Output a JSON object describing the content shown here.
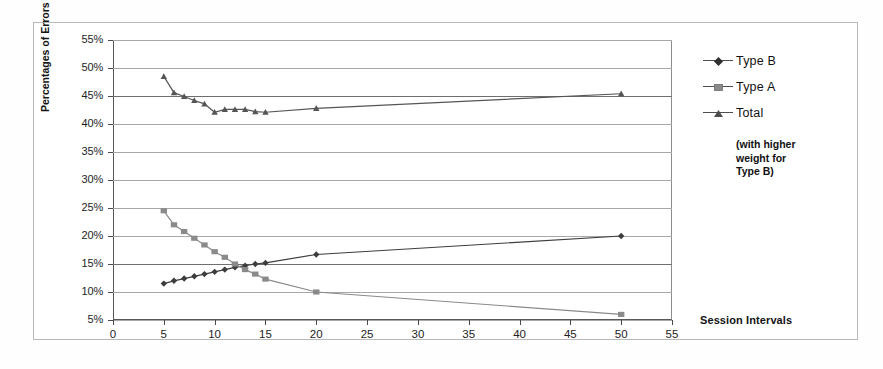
{
  "chart_data": {
    "type": "line",
    "title": "",
    "xlabel": "Session Intervals",
    "ylabel": "Percentages of Errors",
    "xlim": [
      0,
      55
    ],
    "ylim": [
      5,
      55
    ],
    "xticks": [
      0,
      5,
      10,
      15,
      20,
      25,
      30,
      35,
      40,
      45,
      50,
      55
    ],
    "xtick_labels": [
      "0",
      "5",
      "10",
      "15",
      "20",
      "25",
      "30",
      "35",
      "40",
      "45",
      "50",
      "55"
    ],
    "yticks": [
      5,
      10,
      15,
      20,
      25,
      30,
      35,
      40,
      45,
      50,
      55
    ],
    "ytick_labels": [
      "5%",
      "10%",
      "15%",
      "20%",
      "25%",
      "30%",
      "35%",
      "40%",
      "45%",
      "50%",
      "55%"
    ],
    "grid": "horizontal",
    "legend_position": "right",
    "legend_note": "(with higher weight for Type B)",
    "series": [
      {
        "name": "Type B",
        "marker": "diamond",
        "color": "#3d3d3d",
        "x": [
          5,
          6,
          7,
          8,
          9,
          10,
          11,
          12,
          13,
          14,
          15,
          20,
          50
        ],
        "values": [
          11.5,
          12.0,
          12.4,
          12.8,
          13.2,
          13.6,
          14.0,
          14.4,
          14.7,
          15.0,
          15.2,
          16.7,
          20.0
        ]
      },
      {
        "name": "Type A",
        "marker": "square",
        "color": "#8a8a8a",
        "x": [
          5,
          6,
          7,
          8,
          9,
          10,
          11,
          12,
          13,
          14,
          15,
          20,
          50
        ],
        "values": [
          24.5,
          22.0,
          20.8,
          19.6,
          18.4,
          17.2,
          16.2,
          15.0,
          14.0,
          13.2,
          12.3,
          10.0,
          6.0
        ]
      },
      {
        "name": "Total",
        "marker": "triangle",
        "color": "#555555",
        "x": [
          5,
          6,
          7,
          8,
          9,
          10,
          11,
          12,
          13,
          14,
          15,
          20,
          50
        ],
        "values": [
          48.5,
          45.6,
          44.9,
          44.2,
          43.6,
          42.1,
          42.6,
          42.6,
          42.6,
          42.2,
          42.1,
          42.8,
          45.4
        ]
      }
    ]
  },
  "ylabel": "Percentages of Errors",
  "xlabel": "Session Intervals",
  "legend": {
    "items": [
      {
        "label": "Type B"
      },
      {
        "label": "Type A"
      },
      {
        "label": "Total"
      }
    ],
    "note_line1": "(with higher",
    "note_line2": "weight for",
    "note_line3": "Type B)"
  }
}
